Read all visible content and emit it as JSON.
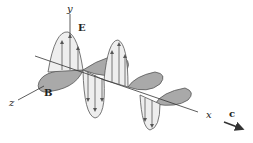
{
  "diagram": {
    "labels": {
      "y_axis": "y",
      "z_axis": "z",
      "x_axis": "x",
      "electric_field": "E",
      "magnetic_field": "B",
      "velocity": "c"
    },
    "colors": {
      "axis": "#333333",
      "e_lobe_fill": "#e8e8e8",
      "b_lobe_fill": "#a9a9a9",
      "outline": "#555555",
      "arrow": "#444444"
    }
  }
}
